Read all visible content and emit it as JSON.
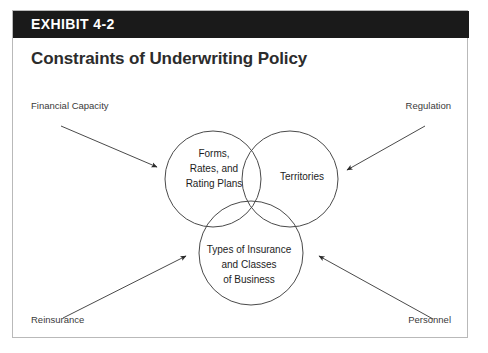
{
  "exhibit": {
    "header_label": "EXHIBIT 4-2",
    "title": "Constraints of Underwriting Policy",
    "header_bg": "#1a1a1a",
    "border_color": "#b9b9b9",
    "title_color": "#2c2c2c"
  },
  "diagram": {
    "type": "venn-three-circle",
    "circles": [
      {
        "id": "forms-rates-rating-plans",
        "lines": [
          "Forms,",
          "Rates, and",
          "Rating Plans"
        ],
        "text": "Forms, Rates, and Rating Plans",
        "position": "top-left"
      },
      {
        "id": "territories",
        "lines": [
          "Territories"
        ],
        "text": "Territories",
        "position": "top-right"
      },
      {
        "id": "types-of-insurance",
        "lines": [
          "Types of Insurance",
          "and Classes",
          "of Business"
        ],
        "text": "Types of Insurance and Classes of Business",
        "position": "bottom-center"
      }
    ],
    "constraint_labels": [
      {
        "id": "financial-capacity",
        "label": "Financial Capacity",
        "corner": "top-left",
        "arrow_direction": "down-right"
      },
      {
        "id": "regulation",
        "label": "Regulation",
        "corner": "top-right",
        "arrow_direction": "down-left"
      },
      {
        "id": "reinsurance",
        "label": "Reinsurance",
        "corner": "bottom-left",
        "arrow_direction": "up-right"
      },
      {
        "id": "personnel",
        "label": "Personnel",
        "corner": "bottom-right",
        "arrow_direction": "up-left"
      }
    ],
    "stroke_color": "#4a4a4a",
    "text_color": "#1d1d1d"
  }
}
